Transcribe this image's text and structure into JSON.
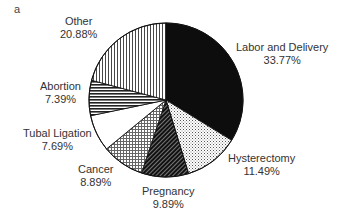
{
  "panel_label": "a",
  "chart_data": {
    "type": "pie",
    "title": "",
    "start_angle": "12 o'clock",
    "direction": "clockwise",
    "categories": [
      "Labor and Delivery",
      "Hysterectomy",
      "Pregnancy",
      "Cancer",
      "Tubal Ligation",
      "Abortion",
      "Other"
    ],
    "values": [
      33.77,
      11.49,
      9.89,
      8.89,
      7.69,
      7.39,
      20.88
    ],
    "unit": "%",
    "slices": [
      {
        "label": "Labor and Delivery",
        "value": 33.77,
        "pct_text": "33.77%",
        "fill": "solid-black"
      },
      {
        "label": "Hysterectomy",
        "value": 11.49,
        "pct_text": "11.49%",
        "fill": "fine-dots"
      },
      {
        "label": "Pregnancy",
        "value": 9.89,
        "pct_text": "9.89%",
        "fill": "dark-diagonal-hatch"
      },
      {
        "label": "Cancer",
        "value": 8.89,
        "pct_text": "8.89%",
        "fill": "cross-grid"
      },
      {
        "label": "Tubal Ligation",
        "value": 7.69,
        "pct_text": "7.69%",
        "fill": "white"
      },
      {
        "label": "Abortion",
        "value": 7.39,
        "pct_text": "7.39%",
        "fill": "horizontal-stripes"
      },
      {
        "label": "Other",
        "value": 20.88,
        "pct_text": "20.88%",
        "fill": "vertical-stripes"
      }
    ],
    "legend": "none (direct labels)"
  }
}
